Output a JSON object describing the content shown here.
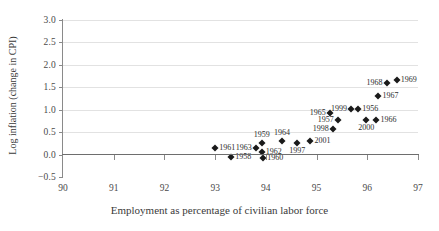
{
  "chart_data": {
    "type": "scatter",
    "title": "",
    "xlabel": "Employment as percentage of civilian labor force",
    "ylabel": "Log inflation (change in CPI)",
    "xlim": [
      90,
      97
    ],
    "ylim": [
      -0.5,
      3.0
    ],
    "xticks": [
      "90",
      "91",
      "92",
      "93",
      "94",
      "95",
      "96",
      "97"
    ],
    "xtick_values": [
      90,
      91,
      92,
      93,
      94,
      95,
      96,
      97
    ],
    "yticks": [
      "3.0",
      "2.5",
      "2.0",
      "1.5",
      "1.0",
      "0.5",
      "0.0",
      "−0.5"
    ],
    "ytick_values": [
      3.0,
      2.5,
      2.0,
      1.5,
      1.0,
      0.5,
      0.0,
      -0.5
    ],
    "grid": "horizontal",
    "legend": "none",
    "marker": "diamond",
    "marker_color": "#1a1a1a",
    "points": [
      {
        "label": "1958",
        "x": 93.32,
        "y": -0.05,
        "pos": "right"
      },
      {
        "label": "1961",
        "x": 93.0,
        "y": 0.15,
        "pos": "right"
      },
      {
        "label": "1963",
        "x": 93.8,
        "y": 0.14,
        "pos": "left"
      },
      {
        "label": "1959",
        "x": 93.92,
        "y": 0.26,
        "pos": "above"
      },
      {
        "label": "1962",
        "x": 93.92,
        "y": 0.05,
        "pos": "right"
      },
      {
        "label": "1960",
        "x": 93.95,
        "y": -0.08,
        "pos": "right"
      },
      {
        "label": "1964",
        "x": 94.32,
        "y": 0.3,
        "pos": "above"
      },
      {
        "label": "1997",
        "x": 94.62,
        "y": 0.25,
        "pos": "below"
      },
      {
        "label": "2001",
        "x": 94.88,
        "y": 0.3,
        "pos": "right"
      },
      {
        "label": "1998",
        "x": 95.32,
        "y": 0.58,
        "pos": "left"
      },
      {
        "label": "1957",
        "x": 95.42,
        "y": 0.76,
        "pos": "left"
      },
      {
        "label": "1965",
        "x": 95.26,
        "y": 0.92,
        "pos": "left"
      },
      {
        "label": "1999",
        "x": 95.68,
        "y": 1.02,
        "pos": "left"
      },
      {
        "label": "1956",
        "x": 95.82,
        "y": 1.02,
        "pos": "right"
      },
      {
        "label": "2000",
        "x": 95.98,
        "y": 0.76,
        "pos": "below"
      },
      {
        "label": "1966",
        "x": 96.18,
        "y": 0.76,
        "pos": "right"
      },
      {
        "label": "1967",
        "x": 96.22,
        "y": 1.3,
        "pos": "right"
      },
      {
        "label": "1968",
        "x": 96.38,
        "y": 1.6,
        "pos": "left"
      },
      {
        "label": "1969",
        "x": 96.58,
        "y": 1.66,
        "pos": "right"
      }
    ]
  }
}
